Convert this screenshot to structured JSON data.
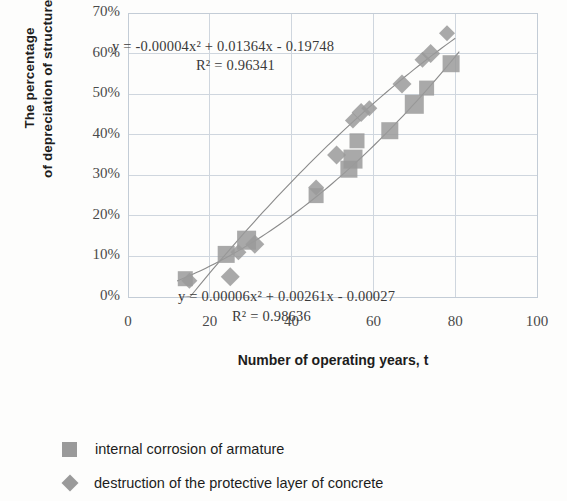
{
  "chart_data": {
    "type": "scatter",
    "title": "",
    "xlabel": "Number of operating years, t",
    "ylabel_line1": "The percentage",
    "ylabel_line2": "of depreciation of structures, τ",
    "xlim": [
      0,
      100
    ],
    "ylim": [
      0,
      70
    ],
    "xticks": [
      "0",
      "20",
      "40",
      "60",
      "80",
      "100"
    ],
    "xtick_values": [
      0,
      20,
      40,
      60,
      80,
      100
    ],
    "yticks": [
      "0%",
      "10%",
      "20%",
      "30%",
      "40%",
      "50%",
      "60%",
      "70%"
    ],
    "ytick_values": [
      0,
      10,
      20,
      30,
      40,
      50,
      60,
      70
    ],
    "grid": true,
    "legend_position": "below",
    "marker_color": "#9a9a9a",
    "trendline_color": "#7d7d7d",
    "series": [
      {
        "name": "internal corrosion of armature",
        "marker": "square",
        "points": [
          {
            "x": 14,
            "y": 4.5
          },
          {
            "x": 24,
            "y": 10.5
          },
          {
            "x": 29,
            "y": 14.0
          },
          {
            "x": 46,
            "y": 25.0
          },
          {
            "x": 54,
            "y": 31.5
          },
          {
            "x": 55,
            "y": 34.0
          },
          {
            "x": 56,
            "y": 38.5
          },
          {
            "x": 64,
            "y": 41.0
          },
          {
            "x": 70,
            "y": 47.5
          },
          {
            "x": 73,
            "y": 51.5
          },
          {
            "x": 79,
            "y": 57.5
          }
        ],
        "trendline": {
          "equation": "y = 0.00006x² + 0.00261x - 0.00027",
          "r2": "R² = 0.98636",
          "a": 6e-05,
          "b": 0.00261,
          "c": -0.00027
        }
      },
      {
        "name": "destruction of the protective layer of concrete",
        "marker": "diamond",
        "points": [
          {
            "x": 15,
            "y": 4.0
          },
          {
            "x": 25,
            "y": 5.0
          },
          {
            "x": 27,
            "y": 11.0
          },
          {
            "x": 31,
            "y": 13.0
          },
          {
            "x": 46,
            "y": 27.0
          },
          {
            "x": 51,
            "y": 35.0
          },
          {
            "x": 55,
            "y": 43.5
          },
          {
            "x": 57,
            "y": 45.5
          },
          {
            "x": 59,
            "y": 46.5
          },
          {
            "x": 67,
            "y": 52.5
          },
          {
            "x": 72,
            "y": 58.5
          },
          {
            "x": 74,
            "y": 60.0
          },
          {
            "x": 78,
            "y": 65.0
          }
        ],
        "trendline": {
          "equation": "y = -0.00004x² + 0.01364x - 0.19748",
          "r2": "R² = 0.96341",
          "a": -4e-05,
          "b": 0.01364,
          "c": -0.19748
        }
      }
    ],
    "annotations": [
      {
        "id": "eq_top",
        "text": "y = -0.00004x² + 0.01364x - 0.19748"
      },
      {
        "id": "r2_top",
        "text": "R² = 0.96341"
      },
      {
        "id": "eq_bot",
        "text": "y = 0.00006x² + 0.00261x - 0.00027"
      },
      {
        "id": "r2_bot",
        "text": "R² = 0.98636"
      }
    ]
  },
  "legend": {
    "items": [
      {
        "label": "internal corrosion of armature",
        "marker": "square"
      },
      {
        "label": "destruction of the protective layer of concrete",
        "marker": "diamond"
      }
    ]
  }
}
